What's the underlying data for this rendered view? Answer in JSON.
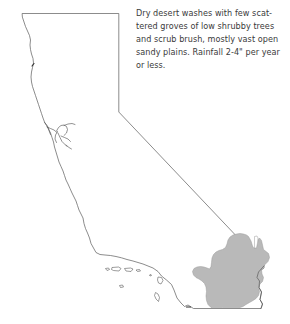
{
  "figure": {
    "background_color": "#ffffff"
  },
  "caption": {
    "full_text": "Dry desert washes with few scattered groves of low shrubby trees and scrub brush, mostly vast open sandy plains. Rainfall 2-4\" per year or less.",
    "lines": [
      "Dry desert washes with few scat-",
      "tered groves of low shrubby trees",
      "and scrub brush, mostly vast open",
      "sandy plains. Rainfall 2-4\" per year",
      "or less."
    ],
    "text_color": "#3a3a3a"
  },
  "map": {
    "state_name": "California",
    "outline_color": "#5a5a5a",
    "fill_color": "#ffffff",
    "highlight_region": {
      "name": "desert-region",
      "fill_color": "#b9b9b9",
      "stroke_color": "#9a9a9a"
    },
    "islands_label": "channel-islands"
  }
}
